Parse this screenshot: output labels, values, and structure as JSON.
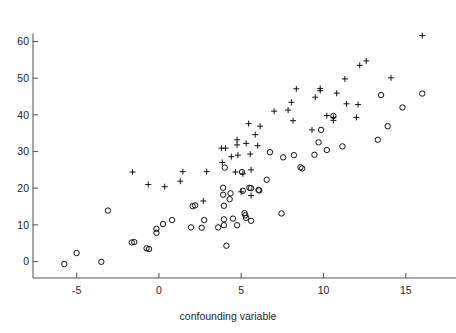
{
  "chart_data": {
    "type": "scatter",
    "title": "",
    "xlabel": "confounding variable",
    "ylabel": "",
    "xlim": [
      -6.8,
      17.2
    ],
    "ylim": [
      -4.5,
      64.5
    ],
    "xticks": [
      -5,
      0,
      5,
      10,
      15
    ],
    "xticklabels": [
      "-5",
      "0",
      "5",
      "10",
      "15"
    ],
    "yticks": [
      0,
      10,
      20,
      30,
      40,
      50,
      60
    ],
    "yticklabels": [
      "0",
      "10",
      "20",
      "30",
      "40",
      "50",
      "60"
    ],
    "grid": false,
    "legend": null,
    "marker_colors": {
      "circle": "#111111",
      "plus": "#111111",
      "axis": "#5a5a5a"
    },
    "series": [
      {
        "name": "control group",
        "marker": "circle",
        "points": [
          [
            -5.75,
            -0.7
          ],
          [
            -5.0,
            2.3
          ],
          [
            -3.5,
            -0.1
          ],
          [
            -3.1,
            13.9
          ],
          [
            -1.65,
            5.2
          ],
          [
            -1.5,
            5.3
          ],
          [
            -0.75,
            3.6
          ],
          [
            -0.6,
            3.4
          ],
          [
            -0.15,
            8.9
          ],
          [
            -0.15,
            7.8
          ],
          [
            0.25,
            10.2
          ],
          [
            0.8,
            11.3
          ],
          [
            1.95,
            9.3
          ],
          [
            2.05,
            15.1
          ],
          [
            2.2,
            15.3
          ],
          [
            2.6,
            9.2
          ],
          [
            2.75,
            11.3
          ],
          [
            3.6,
            9.3
          ],
          [
            3.9,
            20.1
          ],
          [
            3.9,
            18.2
          ],
          [
            3.95,
            15.2
          ],
          [
            3.95,
            11.5
          ],
          [
            3.95,
            9.9
          ],
          [
            4.0,
            25.6
          ],
          [
            4.35,
            18.6
          ],
          [
            4.3,
            17.0
          ],
          [
            4.5,
            11.7
          ],
          [
            4.75,
            9.9
          ],
          [
            4.1,
            4.3
          ],
          [
            5.05,
            24.4
          ],
          [
            5.1,
            19.3
          ],
          [
            5.2,
            13.2
          ],
          [
            5.25,
            12.6
          ],
          [
            5.3,
            11.9
          ],
          [
            5.5,
            20.1
          ],
          [
            5.6,
            20.0
          ],
          [
            5.6,
            11.1
          ],
          [
            6.05,
            19.5
          ],
          [
            6.1,
            19.4
          ],
          [
            6.55,
            22.3
          ],
          [
            6.75,
            29.8
          ],
          [
            7.45,
            13.1
          ],
          [
            7.55,
            28.4
          ],
          [
            8.2,
            29.0
          ],
          [
            8.6,
            25.7
          ],
          [
            8.7,
            25.4
          ],
          [
            9.45,
            29.1
          ],
          [
            9.7,
            32.5
          ],
          [
            9.85,
            35.9
          ],
          [
            10.2,
            30.4
          ],
          [
            10.6,
            39.7
          ],
          [
            11.15,
            31.4
          ],
          [
            13.3,
            33.2
          ],
          [
            13.5,
            45.4
          ],
          [
            13.9,
            36.9
          ],
          [
            14.8,
            42.0
          ],
          [
            16.0,
            45.8
          ]
        ]
      },
      {
        "name": "treatment group",
        "marker": "plus",
        "points": [
          [
            -1.6,
            24.4
          ],
          [
            -0.65,
            21.0
          ],
          [
            0.35,
            20.4
          ],
          [
            1.45,
            24.5
          ],
          [
            1.3,
            21.9
          ],
          [
            2.7,
            16.5
          ],
          [
            2.9,
            24.5
          ],
          [
            3.8,
            30.9
          ],
          [
            4.05,
            30.9
          ],
          [
            3.85,
            27.0
          ],
          [
            4.4,
            28.6
          ],
          [
            4.75,
            33.2
          ],
          [
            4.75,
            31.8
          ],
          [
            4.8,
            29.0
          ],
          [
            4.65,
            24.4
          ],
          [
            5.0,
            19.0
          ],
          [
            5.1,
            23.9
          ],
          [
            5.3,
            32.2
          ],
          [
            5.45,
            37.6
          ],
          [
            5.55,
            29.3
          ],
          [
            5.6,
            25.0
          ],
          [
            5.6,
            18.0
          ],
          [
            5.85,
            34.6
          ],
          [
            6.0,
            31.6
          ],
          [
            6.15,
            36.9
          ],
          [
            7.0,
            41.0
          ],
          [
            7.85,
            41.3
          ],
          [
            8.05,
            43.4
          ],
          [
            8.15,
            38.4
          ],
          [
            8.35,
            47.1
          ],
          [
            9.3,
            35.9
          ],
          [
            9.5,
            44.8
          ],
          [
            9.8,
            47.2
          ],
          [
            9.8,
            46.6
          ],
          [
            10.2,
            39.8
          ],
          [
            10.6,
            39.3
          ],
          [
            10.6,
            38.5
          ],
          [
            10.8,
            45.9
          ],
          [
            11.3,
            49.8
          ],
          [
            11.4,
            43.0
          ],
          [
            12.0,
            39.3
          ],
          [
            12.1,
            42.8
          ],
          [
            12.2,
            53.5
          ],
          [
            12.6,
            54.7
          ],
          [
            14.1,
            50.1
          ],
          [
            16.0,
            61.6
          ]
        ]
      }
    ]
  },
  "layout": {
    "plot_left": 47,
    "plot_right": 442,
    "plot_top": 25,
    "plot_bottom": 278,
    "x_axis_y": 278,
    "y_axis_x": 33,
    "tick_len": 5,
    "x_label_y": 320,
    "x_label_x": 228
  }
}
